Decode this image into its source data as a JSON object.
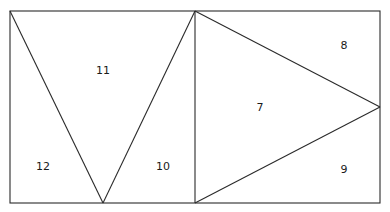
{
  "diagram": {
    "stroke_color": "#2a2a2a",
    "background": "#ffffff",
    "outer_rect": {
      "x1": 10,
      "y1": 11,
      "x2": 380,
      "y2": 203
    },
    "divider": {
      "x": 195
    },
    "left_panel": {
      "v_apex": {
        "x": 103,
        "y": 203
      },
      "regions": [
        {
          "id": "11",
          "label": "11",
          "x": 103,
          "y": 74
        },
        {
          "id": "12",
          "label": "12",
          "x": 43,
          "y": 170
        },
        {
          "id": "10",
          "label": "10",
          "x": 163,
          "y": 170
        }
      ]
    },
    "right_panel": {
      "tri_apex": {
        "x": 380,
        "y": 107
      },
      "regions": [
        {
          "id": "8",
          "label": "8",
          "x": 344,
          "y": 49
        },
        {
          "id": "7",
          "label": "7",
          "x": 260,
          "y": 111
        },
        {
          "id": "9",
          "label": "9",
          "x": 344,
          "y": 173
        }
      ]
    }
  }
}
